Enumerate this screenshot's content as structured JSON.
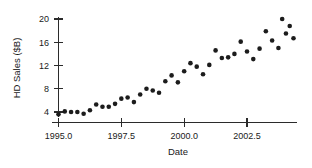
{
  "chart_data": {
    "type": "scatter",
    "title": "",
    "xlabel": "Date",
    "ylabel": "HD Sales ($B)",
    "xlim": [
      1994.6,
      1004.1
    ],
    "ylim": [
      2.6,
      21.2
    ],
    "xticks": [
      1995.0,
      1997.5,
      2000.0,
      2002.5
    ],
    "xticklabels": [
      "1995.0",
      "1997.5",
      "2000.0",
      "2002.5"
    ],
    "yticks": [
      4,
      8,
      12,
      16,
      20
    ],
    "yticklabels": [
      "4",
      "8",
      "12",
      "16",
      "20"
    ],
    "grid": false,
    "legend": null,
    "marker": "filled-circle",
    "marker_color": "#1c1c1c",
    "x": [
      1995.0,
      1995.25,
      1995.5,
      1995.75,
      1996.0,
      1996.25,
      1996.5,
      1996.75,
      1997.0,
      1997.25,
      1997.5,
      1997.75,
      1998.0,
      1998.25,
      1998.5,
      1998.75,
      1999.0,
      1999.25,
      1999.5,
      1999.75,
      2000.0,
      2000.25,
      2000.5,
      2000.75,
      2001.0,
      2001.25,
      2001.5,
      2001.75,
      2002.0,
      2002.25,
      2002.5,
      2002.75,
      2003.0,
      2003.25,
      2003.5,
      2003.75
    ],
    "y": [
      3.6,
      4.1,
      4.0,
      4.0,
      3.7,
      4.3,
      5.3,
      4.9,
      4.9,
      5.4,
      6.3,
      6.5,
      5.7,
      7.0,
      8.0,
      7.7,
      7.3,
      9.3,
      10.3,
      9.1,
      11.0,
      12.4,
      11.8,
      10.5,
      12.1,
      14.6,
      13.3,
      13.4,
      14.0,
      16.1,
      14.4,
      13.1,
      14.9,
      17.9,
      16.3,
      15.0
    ],
    "x_extra": [
      2003.9,
      2004.05,
      2004.2,
      2004.35
    ],
    "y_extra": [
      20.0,
      17.5,
      18.8,
      16.7
    ],
    "points_note": "Quarterly HD Sales in billions of dollars, rising trend 1995-2004"
  },
  "axes": {
    "ylabel_text": "HD Sales ($B)",
    "xlabel_text": "Date"
  }
}
